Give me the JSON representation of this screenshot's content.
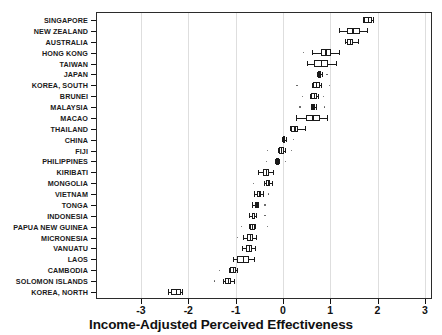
{
  "chart_data": {
    "type": "box",
    "title": "",
    "xlabel": "Income-Adjusted Perceived Effectiveness",
    "ylabel": "",
    "xlim": [
      -3.4,
      3.15
    ],
    "xticks": [
      -3,
      -2,
      -1,
      0,
      1,
      2,
      3
    ],
    "xtick_labels": [
      "-3",
      "-2",
      "-1",
      "0",
      "1",
      "2",
      "3"
    ],
    "grid": "vertical",
    "legend": "none",
    "categories": [
      "SINGAPORE",
      "NEW ZEALAND",
      "AUSTRALIA",
      "HONG KONG",
      "TAIWAN",
      "JAPAN",
      "KOREA, SOUTH",
      "BRUNEI",
      "MALAYSIA",
      "MACAO",
      "THAILAND",
      "CHINA",
      "FIJI",
      "PHILIPPINES",
      "KIRIBATI",
      "MONGOLIA",
      "VIETNAM",
      "TONGA",
      "INDONESIA",
      "PAPUA NEW GUINEA",
      "MICRONESIA",
      "VANUATU",
      "LAOS",
      "CAMBODIA",
      "SOLOMON ISLANDS",
      "KOREA, NORTH"
    ],
    "boxes": [
      {
        "name": "SINGAPORE",
        "whisker_low": 1.7,
        "q1": 1.72,
        "median": 1.8,
        "q3": 1.88,
        "whisker_high": 1.9,
        "outliers": []
      },
      {
        "name": "NEW ZEALAND",
        "whisker_low": 1.18,
        "q1": 1.35,
        "median": 1.47,
        "q3": 1.62,
        "whisker_high": 1.78,
        "outliers": []
      },
      {
        "name": "AUSTRALIA",
        "whisker_low": 1.32,
        "q1": 1.36,
        "median": 1.42,
        "q3": 1.48,
        "whisker_high": 1.58,
        "outliers": []
      },
      {
        "name": "HONG KONG",
        "whisker_low": 0.62,
        "q1": 0.8,
        "median": 0.9,
        "q3": 1.02,
        "whisker_high": 1.18,
        "outliers": [
          0.44
        ]
      },
      {
        "name": "TAIWAN",
        "whisker_low": 0.52,
        "q1": 0.66,
        "median": 0.8,
        "q3": 0.96,
        "whisker_high": 1.12,
        "outliers": []
      },
      {
        "name": "JAPAN",
        "whisker_low": 0.72,
        "q1": 0.74,
        "median": 0.77,
        "q3": 0.8,
        "whisker_high": 0.82,
        "outliers": [
          0.93
        ]
      },
      {
        "name": "KOREA, SOUTH",
        "whisker_low": 0.62,
        "q1": 0.64,
        "median": 0.7,
        "q3": 0.78,
        "whisker_high": 0.8,
        "outliers": [
          0.3,
          0.98
        ]
      },
      {
        "name": "BRUNEI",
        "whisker_low": 0.58,
        "q1": 0.6,
        "median": 0.65,
        "q3": 0.72,
        "whisker_high": 0.74,
        "outliers": [
          0.42,
          0.86
        ]
      },
      {
        "name": "MALAYSIA",
        "whisker_low": 0.6,
        "q1": 0.62,
        "median": 0.64,
        "q3": 0.68,
        "whisker_high": 0.7,
        "outliers": [
          0.36,
          0.88
        ]
      },
      {
        "name": "MACAO",
        "whisker_low": 0.28,
        "q1": 0.48,
        "median": 0.62,
        "q3": 0.78,
        "whisker_high": 0.94,
        "outliers": []
      },
      {
        "name": "THAILAND",
        "whisker_low": 0.14,
        "q1": 0.18,
        "median": 0.24,
        "q3": 0.32,
        "whisker_high": 0.46,
        "outliers": []
      },
      {
        "name": "CHINA",
        "whisker_low": -0.02,
        "q1": 0.0,
        "median": 0.02,
        "q3": 0.05,
        "whisker_high": 0.07,
        "outliers": [
          0.22
        ]
      },
      {
        "name": "FIJI",
        "whisker_low": -0.1,
        "q1": -0.08,
        "median": -0.04,
        "q3": 0.02,
        "whisker_high": 0.04,
        "outliers": [
          -0.32,
          0.18
        ]
      },
      {
        "name": "PHILIPPINES",
        "whisker_low": -0.16,
        "q1": -0.14,
        "median": -0.12,
        "q3": -0.1,
        "whisker_high": -0.08,
        "outliers": [
          -0.34,
          0.06
        ]
      },
      {
        "name": "KIRIBATI",
        "whisker_low": -0.52,
        "q1": -0.42,
        "median": -0.36,
        "q3": -0.3,
        "whisker_high": -0.2,
        "outliers": []
      },
      {
        "name": "MONGOLIA",
        "whisker_low": -0.4,
        "q1": -0.36,
        "median": -0.32,
        "q3": -0.28,
        "whisker_high": -0.24,
        "outliers": [
          -0.62
        ]
      },
      {
        "name": "VIETNAM",
        "whisker_low": -0.62,
        "q1": -0.54,
        "median": -0.5,
        "q3": -0.46,
        "whisker_high": -0.42,
        "outliers": [
          -0.3
        ]
      },
      {
        "name": "TONGA",
        "whisker_low": -0.66,
        "q1": -0.6,
        "median": -0.56,
        "q3": -0.54,
        "whisker_high": -0.52,
        "outliers": [
          -0.38
        ]
      },
      {
        "name": "INDONESIA",
        "whisker_low": -0.72,
        "q1": -0.66,
        "median": -0.62,
        "q3": -0.58,
        "whisker_high": -0.56,
        "outliers": [
          -0.38
        ]
      },
      {
        "name": "PAPUA NEW GUINEA",
        "whisker_low": -0.72,
        "q1": -0.7,
        "median": -0.66,
        "q3": -0.6,
        "whisker_high": -0.58,
        "outliers": [
          -0.88,
          -0.32
        ]
      },
      {
        "name": "MICRONESIA",
        "whisker_low": -0.84,
        "q1": -0.76,
        "median": -0.7,
        "q3": -0.64,
        "whisker_high": -0.56,
        "outliers": [
          -0.96
        ]
      },
      {
        "name": "VANUATU",
        "whisker_low": -0.86,
        "q1": -0.78,
        "median": -0.72,
        "q3": -0.66,
        "whisker_high": -0.6,
        "outliers": []
      },
      {
        "name": "LAOS",
        "whisker_low": -1.06,
        "q1": -0.96,
        "median": -0.84,
        "q3": -0.72,
        "whisker_high": -0.62,
        "outliers": []
      },
      {
        "name": "CAMBODIA",
        "whisker_low": -1.14,
        "q1": -1.12,
        "median": -1.06,
        "q3": -1.0,
        "whisker_high": -0.98,
        "outliers": [
          -1.34
        ]
      },
      {
        "name": "SOLOMON ISLANDS",
        "whisker_low": -1.26,
        "q1": -1.22,
        "median": -1.16,
        "q3": -1.1,
        "whisker_high": -1.04,
        "outliers": [
          -1.44
        ]
      },
      {
        "name": "KOREA, NORTH",
        "whisker_low": -2.42,
        "q1": -2.36,
        "median": -2.26,
        "q3": -2.16,
        "whisker_high": -2.14,
        "outliers": []
      }
    ]
  },
  "colors": {
    "axis": "#2b2b2b",
    "grid": "#dedede",
    "box_stroke": "#1a1a1a",
    "box_fill": "#ffffff",
    "outlier": "#555555",
    "text": "#111111"
  }
}
